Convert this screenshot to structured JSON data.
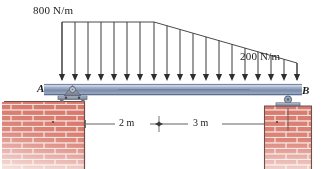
{
  "figure": {
    "type": "beam-loading-diagram"
  },
  "loads": {
    "left_intensity": "800 N/m",
    "right_intensity": "200 N/m",
    "left_value": 800,
    "right_value": 200,
    "units": "N/m"
  },
  "supports": {
    "left_label": "A",
    "left_type": "pin-support",
    "right_label": "B",
    "right_type": "roller-support"
  },
  "dimensions": {
    "segment_1": "2 m",
    "segment_2": "3 m",
    "segment_1_value": 2,
    "segment_2_value": 3,
    "total": 5
  },
  "colors": {
    "beam": "#8fa0bd",
    "beam_dark": "#5d6f91",
    "brick": "#d8776b",
    "brick_mortar": "#f0ded8",
    "arrow": "#3a3a3a",
    "support_metal": "#9aa3b4",
    "text": "#1a1a1a"
  }
}
